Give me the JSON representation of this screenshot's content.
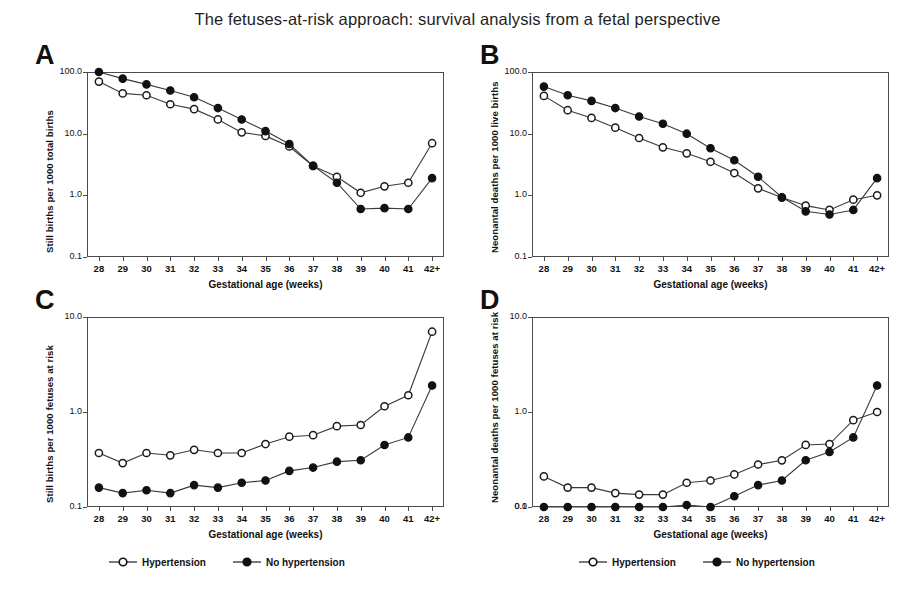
{
  "figure": {
    "title": "The fetuses-at-risk approach: survival analysis from a fetal perspective",
    "xlabel": "Gestational age (weeks)",
    "categories": [
      "28",
      "29",
      "30",
      "31",
      "32",
      "33",
      "34",
      "35",
      "36",
      "37",
      "38",
      "39",
      "40",
      "41",
      "42+"
    ],
    "series_names": [
      "Hypertension",
      "No hypertension"
    ],
    "marker_colors": {
      "hypertension": "#ffffff",
      "no_hypertension": "#111111",
      "line": "#3a3a3a"
    }
  },
  "legend": {
    "left": {
      "hypertension_label": "Hypertension",
      "no_hypertension_label": "No hypertension"
    },
    "right": {
      "hypertension_label": "Hypertension",
      "no_hypertension_label": "No hypertension"
    }
  },
  "panels": {
    "a": {
      "letter": "A",
      "ylabel": "Still births per 1000 total births",
      "xlabel": "Gestational age (weeks)",
      "yticks": [
        "100.0",
        "10.0",
        "1.0",
        "0.1"
      ]
    },
    "b": {
      "letter": "B",
      "ylabel": "Neonantal deaths per 1000 live births",
      "xlabel": "Gestational age (weeks)",
      "yticks": [
        "100.0",
        "10.0",
        "1.0",
        "0.1"
      ]
    },
    "c": {
      "letter": "C",
      "ylabel": "Still births per 1000 fetuses at risk",
      "xlabel": "Gestational age (weeks)",
      "yticks": [
        "10.0",
        "1.0",
        "0.1"
      ]
    },
    "d": {
      "letter": "D",
      "ylabel": "Neonantal deaths per 1000 fetuses at risk",
      "xlabel": "Gestational age (weeks)",
      "yticks": [
        "10.0",
        "1.0",
        "0.1",
        "0.0"
      ]
    }
  },
  "chart_data": [
    {
      "panel": "A",
      "type": "line",
      "title": "A",
      "xlabel": "Gestational age (weeks)",
      "ylabel": "Still births per 1000 total births",
      "yscale": "log",
      "ylim": [
        0.1,
        100.0
      ],
      "yticks": [
        0.1,
        1.0,
        10.0,
        100.0
      ],
      "grid": false,
      "legend_position": "below-figure",
      "categories": [
        "28",
        "29",
        "30",
        "31",
        "32",
        "33",
        "34",
        "35",
        "36",
        "37",
        "38",
        "39",
        "40",
        "41",
        "42+"
      ],
      "series": [
        {
          "name": "Hypertension",
          "marker": "open-circle",
          "values": [
            70,
            45,
            42,
            30,
            25,
            17,
            10.5,
            9.2,
            6.2,
            3.0,
            2.0,
            1.1,
            1.4,
            1.6,
            7.0
          ]
        },
        {
          "name": "No hypertension",
          "marker": "filled-circle",
          "values": [
            100,
            78,
            63,
            50,
            39,
            26,
            17,
            11,
            6.8,
            3.0,
            1.6,
            0.6,
            0.62,
            0.6,
            1.9
          ]
        }
      ]
    },
    {
      "panel": "B",
      "type": "line",
      "title": "B",
      "xlabel": "Gestational age (weeks)",
      "ylabel": "Neonantal deaths per 1000 live births",
      "yscale": "log",
      "ylim": [
        0.1,
        100.0
      ],
      "yticks": [
        0.1,
        1.0,
        10.0,
        100.0
      ],
      "grid": false,
      "legend_position": "below-figure",
      "categories": [
        "28",
        "29",
        "30",
        "31",
        "32",
        "33",
        "34",
        "35",
        "36",
        "37",
        "38",
        "39",
        "40",
        "41",
        "42+"
      ],
      "series": [
        {
          "name": "Hypertension",
          "marker": "open-circle",
          "values": [
            41,
            24,
            18,
            12.5,
            8.5,
            6.0,
            4.8,
            3.5,
            2.3,
            1.3,
            0.92,
            0.68,
            0.58,
            0.85,
            1.0
          ]
        },
        {
          "name": "No hypertension",
          "marker": "filled-circle",
          "values": [
            58,
            42,
            34,
            26,
            19,
            14.5,
            10,
            5.8,
            3.7,
            2.0,
            0.93,
            0.55,
            0.49,
            0.58,
            1.9
          ]
        }
      ]
    },
    {
      "panel": "C",
      "type": "line",
      "title": "C",
      "xlabel": "Gestational age (weeks)",
      "ylabel": "Still births per 1000 fetuses at risk",
      "yscale": "log",
      "ylim": [
        0.1,
        10.0
      ],
      "yticks": [
        0.1,
        1.0,
        10.0
      ],
      "grid": false,
      "legend_position": "below-figure",
      "categories": [
        "28",
        "29",
        "30",
        "31",
        "32",
        "33",
        "34",
        "35",
        "36",
        "37",
        "38",
        "39",
        "40",
        "41",
        "42+"
      ],
      "series": [
        {
          "name": "Hypertension",
          "marker": "open-circle",
          "values": [
            0.37,
            0.29,
            0.37,
            0.35,
            0.4,
            0.37,
            0.37,
            0.46,
            0.55,
            0.57,
            0.71,
            0.73,
            1.15,
            1.5,
            7.0
          ]
        },
        {
          "name": "No hypertension",
          "marker": "filled-circle",
          "values": [
            0.16,
            0.14,
            0.15,
            0.14,
            0.17,
            0.16,
            0.18,
            0.19,
            0.24,
            0.26,
            0.3,
            0.31,
            0.45,
            0.54,
            1.9
          ]
        }
      ]
    },
    {
      "panel": "D",
      "type": "line",
      "title": "D",
      "xlabel": "Gestational age (weeks)",
      "ylabel": "Neonantal deaths per 1000 fetuses at risk",
      "yscale": "log",
      "ylim": [
        0.1,
        10.0
      ],
      "yticks": [
        0.1,
        1.0,
        10.0
      ],
      "grid": false,
      "legend_position": "below-figure",
      "categories": [
        "28",
        "29",
        "30",
        "31",
        "32",
        "33",
        "34",
        "35",
        "36",
        "37",
        "38",
        "39",
        "40",
        "41",
        "42+"
      ],
      "series": [
        {
          "name": "Hypertension",
          "marker": "open-circle",
          "values": [
            0.21,
            0.16,
            0.16,
            0.14,
            0.135,
            0.135,
            0.18,
            0.19,
            0.22,
            0.28,
            0.31,
            0.45,
            0.46,
            0.82,
            1.0
          ]
        },
        {
          "name": "No hypertension",
          "marker": "filled-circle",
          "values": [
            0.087,
            0.072,
            0.075,
            0.074,
            0.08,
            0.088,
            0.105,
            0.1,
            0.13,
            0.17,
            0.19,
            0.31,
            0.38,
            0.54,
            1.9
          ]
        }
      ]
    }
  ]
}
